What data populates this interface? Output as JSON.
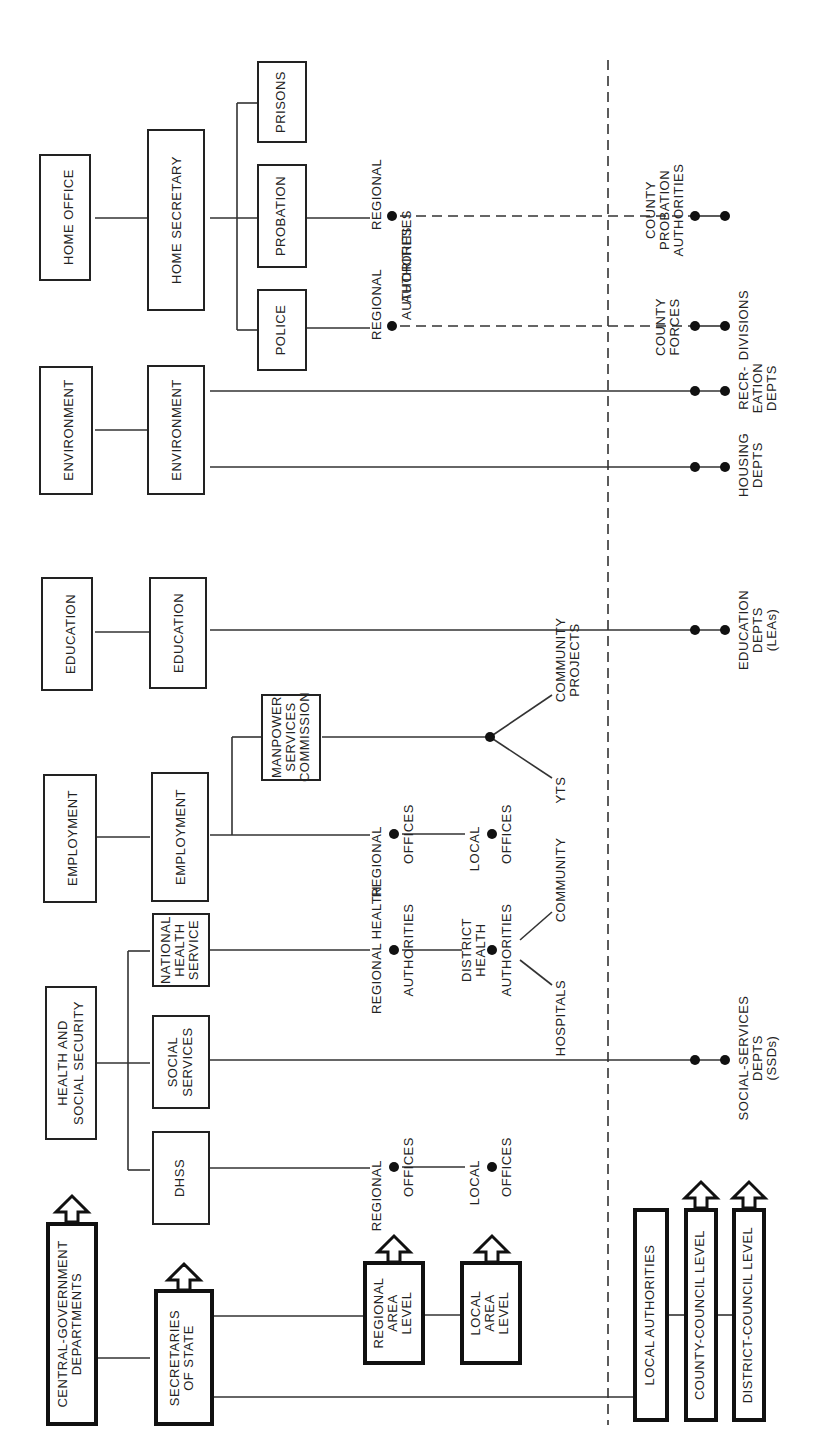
{
  "diagram": {
    "orientation": "rotated-90-ccw",
    "legend": {
      "central": [
        "CENTRAL-GOVERNMENT",
        "DEPARTMENTS"
      ],
      "secretaries": [
        "SECRETARIES",
        "OF STATE"
      ],
      "regional_level": [
        "REGIONAL",
        "AREA",
        "LEVEL"
      ],
      "local_level": [
        "LOCAL",
        "AREA",
        "LEVEL"
      ],
      "local_authorities": "LOCAL AUTHORITIES",
      "county_council": "COUNTY-COUNCIL LEVEL",
      "district_council": "DISTRICT-COUNCIL LEVEL"
    },
    "departments": {
      "home_office": "HOME OFFICE",
      "environment": "ENVIRONMENT",
      "education": "EDUCATION",
      "employment": "EMPLOYMENT",
      "health": [
        "HEALTH AND",
        "SOCIAL SECURITY"
      ]
    },
    "secretaries": {
      "home_secretary": "HOME SECRETARY",
      "environment": "ENVIRONMENT",
      "education": "EDUCATION",
      "employment": "EMPLOYMENT",
      "nhs": [
        "NATIONAL",
        "HEALTH",
        "SERVICE"
      ],
      "social_services": [
        "SOCIAL",
        "SERVICES"
      ],
      "dhss": "DHSS"
    },
    "sub_units": {
      "prisons": "PRISONS",
      "probation": "PROBATION",
      "police": "POLICE",
      "msc": [
        "MANPOWER",
        "SERVICES",
        "COMMISSION"
      ]
    },
    "regional_nodes": {
      "probation": [
        "REGIONAL",
        "AUTHORITIES"
      ],
      "police": [
        "REGIONAL",
        "AUTHORITIES"
      ],
      "employment": [
        "REGIONAL",
        "OFFICES"
      ],
      "nhs": [
        "REGIONAL HEALTH",
        "AUTHORITIES"
      ],
      "dhss": [
        "REGIONAL",
        "OFFICES"
      ]
    },
    "local_nodes": {
      "employment": [
        "LOCAL",
        "OFFICES"
      ],
      "nhs": [
        "DISTRICT",
        "HEALTH",
        "AUTHORITIES"
      ],
      "dhss": [
        "LOCAL",
        "OFFICES"
      ],
      "msc_yts": "YTS",
      "msc_community": [
        "COMMUNITY",
        "PROJECTS"
      ],
      "nhs_hospitals": "HOSPITALS",
      "nhs_community": "COMMUNITY"
    },
    "local_authority_nodes": {
      "probation": [
        "COUNTY",
        "PROBATION",
        "AUTHORITIES"
      ],
      "police": [
        "COUNTY",
        "FORCES"
      ],
      "police_divisions": "DIVISIONS",
      "recreation": [
        "RECR-",
        "EATION",
        "DEPTS"
      ],
      "housing": [
        "HOUSING",
        "DEPTS"
      ],
      "education": [
        "EDUCATION",
        "DEPTS",
        "(LEAs)"
      ],
      "social_services": [
        "SOCIAL-SERVICES",
        "DEPTS",
        "(SSDs)"
      ]
    }
  }
}
